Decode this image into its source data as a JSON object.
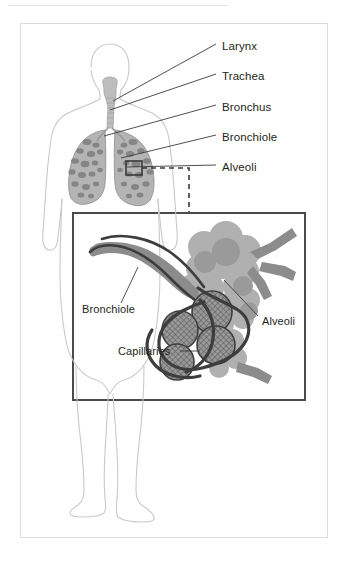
{
  "page": {
    "background_color": "#ffffff",
    "top_rule_color": "#e3e3e6",
    "card_border_color": "#dcdcdf"
  },
  "colors": {
    "body_outline": "#c9c9cc",
    "lung_fill": "#b4b4b4",
    "lung_texture": "#7d7d7d",
    "trachea_fill": "#bdbdbd",
    "leader_line": "#3a3a3a",
    "label_text": "#231f20",
    "detail_border": "#4a4a4a",
    "bronchiole_fill": "#8c8c8c",
    "alveoli_fill": "#b0b0b0",
    "alveoli_fill_dark": "#9a9a9a",
    "capillary_line": "#3d3d3d",
    "capillary_mesh": "#555555",
    "callout_box": "#3a3a3a",
    "dashed_line": "#3a3a3a"
  },
  "main_diagram": {
    "name": "human-torso-respiratory-overview",
    "callout_box_label": "zoom-region-marker",
    "labels": [
      {
        "id": "larynx",
        "text": "Larynx",
        "x": 222,
        "y": 47,
        "line": {
          "x1": 216,
          "y1": 50,
          "x2": 113,
          "y2": 101
        }
      },
      {
        "id": "trachea",
        "text": "Trachea",
        "x": 222,
        "y": 77,
        "line": {
          "x1": 216,
          "y1": 80,
          "x2": 110,
          "y2": 110
        }
      },
      {
        "id": "bronchus",
        "text": "Bronchus",
        "x": 222,
        "y": 108,
        "line": {
          "x1": 216,
          "y1": 111,
          "x2": 104,
          "y2": 136
        }
      },
      {
        "id": "bronchiole",
        "text": "Bronchiole",
        "x": 222,
        "y": 138,
        "line": {
          "x1": 216,
          "y1": 141,
          "x2": 121,
          "y2": 158
        }
      },
      {
        "id": "alveoli",
        "text": "Alveoli",
        "x": 222,
        "y": 168,
        "line": {
          "x1": 216,
          "y1": 171,
          "x2": 127,
          "y2": 166
        }
      }
    ]
  },
  "detail_panel": {
    "name": "alveoli-closeup-panel",
    "labels": [
      {
        "id": "bronchiole",
        "text": "Bronchiole",
        "x": 82,
        "y": 310,
        "line": {
          "x1": 121,
          "y1": 303,
          "x2": 138,
          "y2": 267
        }
      },
      {
        "id": "alveoli",
        "text": "Alveoli",
        "x": 262,
        "y": 322,
        "line": {
          "x1": 258,
          "y1": 316,
          "x2": 224,
          "y2": 278
        }
      },
      {
        "id": "capillaries",
        "text": "Capillaries",
        "x": 122,
        "y": 355,
        "line": {
          "x1": 180,
          "y1": 351,
          "x2": 203,
          "y2": 351
        }
      }
    ]
  }
}
